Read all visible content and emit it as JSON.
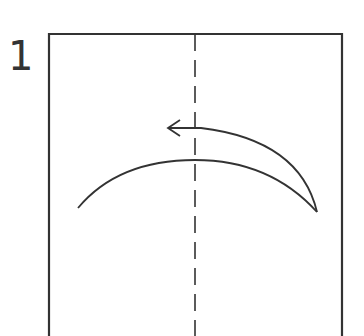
{
  "diagram": {
    "type": "origami-instruction",
    "step_number": "1",
    "paper": {
      "shape": "rectangle",
      "x": 49,
      "y": 34,
      "width": 293,
      "extends_below_view": true
    },
    "fold_line": {
      "style": "dashed",
      "kind": "valley-fold",
      "orientation": "vertical",
      "x": 195
    },
    "arrow": {
      "direction": "left",
      "meaning": "fold right half over to the left"
    },
    "colors": {
      "line": "#333333",
      "background": "#ffffff"
    }
  }
}
